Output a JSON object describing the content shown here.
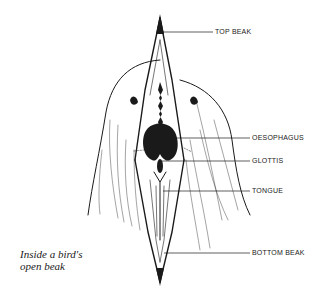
{
  "diagram": {
    "title": "Inside a bird's open beak",
    "caption_lines": [
      "Inside a bird's",
      "open beak"
    ],
    "labels": [
      {
        "id": "top-beak",
        "text": "TOP BEAK"
      },
      {
        "id": "oesophagus",
        "text": "OESOPHAGUS"
      },
      {
        "id": "glottis",
        "text": "GLOTTIS"
      },
      {
        "id": "tongue",
        "text": "TONGUE"
      },
      {
        "id": "bottom-beak",
        "text": "BOTTOM BEAK"
      }
    ],
    "colors": {
      "ink": "#1a1a1a",
      "background": "#ffffff"
    }
  }
}
